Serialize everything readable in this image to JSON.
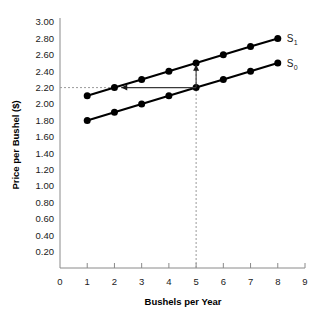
{
  "chart_data": {
    "type": "line",
    "title": "",
    "xlabel": "Bushels per Year",
    "ylabel": "Price per Bushel ($)",
    "xlim": [
      0,
      9
    ],
    "ylim": [
      0,
      3.0
    ],
    "grid": false,
    "legend_position": "right-inline",
    "x": [
      1,
      2,
      3,
      4,
      5,
      6,
      7,
      8
    ],
    "xticks": [
      "0",
      "1",
      "2",
      "3",
      "4",
      "5",
      "6",
      "7",
      "8",
      "9"
    ],
    "yticks": [
      "0.20",
      "0.40",
      "0.60",
      "0.80",
      "1.00",
      "1.20",
      "1.40",
      "1.60",
      "1.80",
      "2.00",
      "2.20",
      "2.40",
      "2.60",
      "2.80",
      "3.00"
    ],
    "series": [
      {
        "name": "S1",
        "label_base": "S",
        "label_sub": "1",
        "values": [
          2.1,
          2.2,
          2.3,
          2.4,
          2.5,
          2.6,
          2.7,
          2.8
        ],
        "color": "#000000"
      },
      {
        "name": "S0",
        "label_base": "S",
        "label_sub": "0",
        "values": [
          1.8,
          1.9,
          2.0,
          2.1,
          2.2,
          2.3,
          2.4,
          2.5
        ],
        "color": "#000000"
      }
    ],
    "annotations": [
      {
        "name": "price-guide-horizontal",
        "type": "dashed-line",
        "orientation": "horizontal",
        "y_value": 2.2,
        "x_from": 0,
        "x_to": 2.05
      },
      {
        "name": "quantity-guide-vertical",
        "type": "dashed-line",
        "orientation": "vertical",
        "x_value": 5,
        "y_from": 0,
        "y_to": 2.5
      },
      {
        "name": "supply-shift-up-arrow",
        "type": "arrow",
        "direction": "up",
        "x_value": 5,
        "y_from": 2.2,
        "y_to": 2.48
      },
      {
        "name": "quantity-decrease-left-arrow",
        "type": "arrow",
        "direction": "left",
        "y_value": 2.2,
        "x_from": 5,
        "x_to": 2.25
      }
    ]
  },
  "axes": {
    "x_title": "Bushels per Year",
    "y_title": "Price per Bushel ($)"
  },
  "colors": {
    "line": "#000000",
    "axis": "#8a8a8a",
    "guide": "#9a9a9a",
    "background": "#ffffff"
  }
}
